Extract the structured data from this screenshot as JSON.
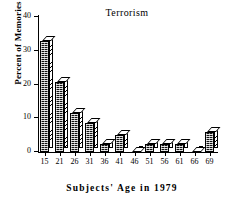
{
  "chart_data": {
    "type": "bar",
    "title": "Terrorism",
    "xlabel": "Subjects' Age in 1979",
    "ylabel": "Percent of Memories",
    "categories": [
      "15",
      "21",
      "26",
      "31",
      "36",
      "41",
      "46",
      "51",
      "56",
      "61",
      "66",
      "69"
    ],
    "values": [
      33,
      20.7,
      11.5,
      8.5,
      2.5,
      5,
      0,
      2.5,
      2.5,
      2.5,
      0,
      6
    ],
    "ylim": [
      0,
      40
    ],
    "yticks": [
      0,
      10,
      20,
      30,
      40
    ],
    "ytick_labels": [
      "0",
      "10",
      "20",
      "30",
      "40"
    ],
    "grid": false,
    "legend": "none",
    "style": "3d-bars"
  },
  "axis": {
    "y_tick_labels": [
      "40",
      "30",
      "20",
      "10",
      "0"
    ],
    "x_tick_labels": [
      "15",
      "21",
      "26",
      "31",
      "36",
      "41",
      "46",
      "51",
      "56",
      "61",
      "66",
      "69"
    ]
  }
}
